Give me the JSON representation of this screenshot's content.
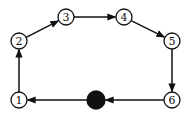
{
  "diagram": {
    "type": "directed-cycle-graph",
    "nodes": [
      {
        "id": "1",
        "label": "1",
        "x": 19,
        "y": 100
      },
      {
        "id": "2",
        "label": "2",
        "x": 19,
        "y": 41
      },
      {
        "id": "3",
        "label": "3",
        "x": 66,
        "y": 17
      },
      {
        "id": "4",
        "label": "4",
        "x": 124,
        "y": 17
      },
      {
        "id": "5",
        "label": "5",
        "x": 172,
        "y": 41
      },
      {
        "id": "6",
        "label": "6",
        "x": 172,
        "y": 100
      },
      {
        "id": "dot",
        "label": "",
        "x": 96,
        "y": 100,
        "filled": true
      }
    ],
    "edges": [
      {
        "from": "1",
        "to": "2"
      },
      {
        "from": "2",
        "to": "3"
      },
      {
        "from": "3",
        "to": "4"
      },
      {
        "from": "4",
        "to": "5"
      },
      {
        "from": "5",
        "to": "6"
      },
      {
        "from": "6",
        "to": "dot"
      },
      {
        "from": "dot",
        "to": "1"
      }
    ],
    "colors": {
      "stroke": "#111111",
      "fill": "#ffffff",
      "dot": "#111111"
    }
  }
}
